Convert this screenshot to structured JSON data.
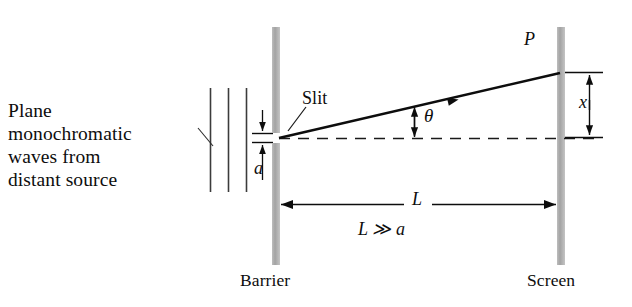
{
  "figure": {
    "domain": "diagram",
    "background_color": "#ffffff",
    "ink_color": "#0d0d0d",
    "bar_color": "#a8a8a8",
    "width": 632,
    "height": 307
  },
  "labels": {
    "source": "Plane\nmonochromatic\nwaves from\ndistant source",
    "slit": "Slit",
    "slit_width": "a",
    "angle": "θ",
    "point": "P",
    "displacement": "x",
    "distance": "L",
    "condition": "L ≫ a",
    "barrier": "Barrier",
    "screen": "Screen"
  },
  "elements": {
    "wavefronts": {
      "name": "plane-wavefront-lines",
      "count": 3,
      "x_positions": [
        210,
        228,
        246
      ],
      "y_top": 88,
      "y_bottom": 192
    },
    "barrier": {
      "name": "barrier-bar",
      "x": 272,
      "width": 8,
      "upper_top": 27,
      "upper_bottom": 133,
      "lower_top": 143,
      "lower_bottom": 265
    },
    "screen": {
      "name": "screen-bar",
      "x": 557,
      "width": 8,
      "top": 27,
      "bottom": 265
    },
    "slit_gap": {
      "name": "slit-opening",
      "y_top": 133,
      "y_bottom": 143
    },
    "axis": {
      "name": "optical-axis-dashed",
      "y": 138,
      "x_start": 279,
      "x_end": 600,
      "style": "dashed"
    },
    "ray": {
      "name": "diffracted-ray",
      "from_x": 279,
      "from_y": 138,
      "to_x": 560,
      "to_y": 73,
      "arrow_at": 0.6
    },
    "angle_marker": {
      "name": "theta-double-arrow",
      "x": 414,
      "y_top": 107,
      "y_bottom": 138
    },
    "x_dimension": {
      "name": "x-dimension-arrow",
      "x": 590,
      "y_top": 72,
      "y_bottom": 137
    },
    "L_dimension": {
      "name": "L-dimension-arrow",
      "y": 204,
      "x_left": 280,
      "x_right": 557
    },
    "a_dimension": {
      "name": "a-dimension-arrow",
      "x": 262,
      "y_top": 110,
      "y_bottom": 180
    },
    "leaders": {
      "source_leader": {
        "name": "source-leader-line",
        "x1": 200,
        "y1": 129,
        "x2": 214,
        "y2": 145
      },
      "slit_leader": {
        "name": "slit-leader-line",
        "x1": 305,
        "y1": 108,
        "x2": 288,
        "y2": 132
      }
    }
  }
}
